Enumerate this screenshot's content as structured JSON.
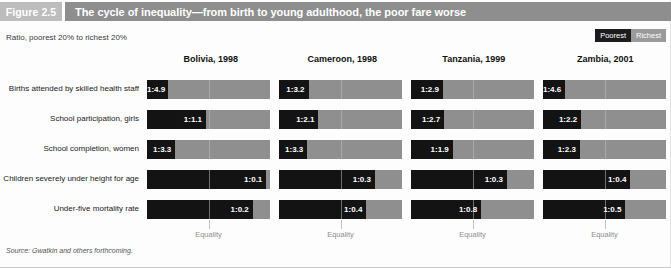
{
  "figure": {
    "number_label": "Figure 2.5",
    "title": "The cycle of inequality—from birth to young adulthood, the poor fare worse",
    "subtitle": "Ratio, poorest 20% to richest 20%",
    "source": "Source: Gwatkin and others forthcoming.",
    "equality_label": "Equality"
  },
  "legend": {
    "poorest": "Poorest",
    "richest": "Richest",
    "poorest_color": "#131313",
    "richest_color": "#8f8f8f"
  },
  "chart_data": {
    "type": "bar",
    "title": "The cycle of inequality—from birth to young adulthood, the poor fare worse",
    "subtitle": "Ratio, poorest 20% to richest 20%",
    "xlabel": "",
    "ylabel": "",
    "grid": false,
    "legend_position": "top-right",
    "note": "Each bar is a 100% stacked split: black = poorest 20% share, gray = richest 20% share. Printed label is the poorest:richest ratio.",
    "series": [
      {
        "name": "Poorest",
        "color": "#131313"
      },
      {
        "name": "Richest",
        "color": "#8f8f8f"
      }
    ],
    "columns": [
      "Bolivia, 1998",
      "Cameroon, 1998",
      "Tanzania, 1999",
      "Zambia, 2001"
    ],
    "categories": [
      "Births attended by skilled health staff",
      "School participation, girls",
      "School completion, women",
      "Children severely under height for age",
      "Under-five mortality rate"
    ],
    "rows": [
      {
        "label": "Births attended by skilled health staff",
        "cells": [
          {
            "country": "Bolivia, 1998",
            "ratio": "1:4.9",
            "richest": 4.9,
            "poor_fraction": 0.17
          },
          {
            "country": "Cameroon, 1998",
            "ratio": "1:3.2",
            "richest": 3.2,
            "poor_fraction": 0.24
          },
          {
            "country": "Tanzania, 1999",
            "ratio": "1:2.9",
            "richest": 2.9,
            "poor_fraction": 0.26
          },
          {
            "country": "Zambia, 2001",
            "ratio": "1:4.6",
            "richest": 4.6,
            "poor_fraction": 0.18
          }
        ]
      },
      {
        "label": "School participation, girls",
        "cells": [
          {
            "country": "Bolivia, 1998",
            "ratio": "1:1.1",
            "richest": 1.1,
            "poor_fraction": 0.48
          },
          {
            "country": "Cameroon, 1998",
            "ratio": "1:2.1",
            "richest": 2.1,
            "poor_fraction": 0.32
          },
          {
            "country": "Tanzania, 1999",
            "ratio": "1:2.7",
            "richest": 2.7,
            "poor_fraction": 0.27
          },
          {
            "country": "Zambia, 2001",
            "ratio": "1:2.2",
            "richest": 2.2,
            "poor_fraction": 0.31
          }
        ]
      },
      {
        "label": "School completion, women",
        "cells": [
          {
            "country": "Bolivia, 1998",
            "ratio": "1:3.3",
            "richest": 3.3,
            "poor_fraction": 0.23
          },
          {
            "country": "Cameroon, 1998",
            "ratio": "1:3.3",
            "richest": 3.3,
            "poor_fraction": 0.23
          },
          {
            "country": "Tanzania, 1999",
            "ratio": "1:1.9",
            "richest": 1.9,
            "poor_fraction": 0.34
          },
          {
            "country": "Zambia, 2001",
            "ratio": "1:2.3",
            "richest": 2.3,
            "poor_fraction": 0.3
          }
        ]
      },
      {
        "label": "Children severely under height for age",
        "cells": [
          {
            "country": "Bolivia, 1998",
            "ratio": "1:0.1",
            "richest": 0.1,
            "poor_fraction": 0.97
          },
          {
            "country": "Cameroon, 1998",
            "ratio": "1:0.3",
            "richest": 0.3,
            "poor_fraction": 0.78
          },
          {
            "country": "Tanzania, 1999",
            "ratio": "1:0.3",
            "richest": 0.3,
            "poor_fraction": 0.78
          },
          {
            "country": "Zambia, 2001",
            "ratio": "1:0.4",
            "richest": 0.4,
            "poor_fraction": 0.71
          }
        ]
      },
      {
        "label": "Under-five mortality rate",
        "cells": [
          {
            "country": "Bolivia, 1998",
            "ratio": "1:0.2",
            "richest": 0.2,
            "poor_fraction": 0.86
          },
          {
            "country": "Cameroon, 1998",
            "ratio": "1:0.4",
            "richest": 0.4,
            "poor_fraction": 0.71
          },
          {
            "country": "Tanzania, 1999",
            "ratio": "1:0.8",
            "richest": 0.8,
            "poor_fraction": 0.57
          },
          {
            "country": "Zambia, 2001",
            "ratio": "1:0.5",
            "richest": 0.5,
            "poor_fraction": 0.67
          }
        ]
      }
    ],
    "equality_marker": {
      "label": "Equality",
      "position_fraction": 0.5
    }
  }
}
